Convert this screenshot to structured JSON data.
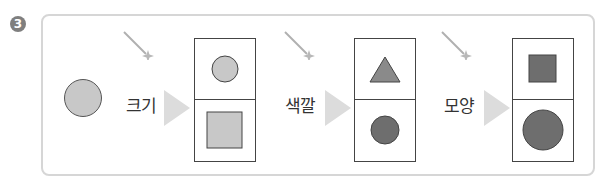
{
  "problem_number": "3",
  "start_shape": {
    "type": "circle",
    "size": "small",
    "color": "#c8c8c8"
  },
  "colors": {
    "light": "#c8c8c8",
    "dark": "#6e6e6e",
    "medium": "#8a8a8a",
    "arrow": "#dcdcdc",
    "frame": "#d6d6d6",
    "badge": "#7f7f7f"
  },
  "steps": [
    {
      "label": "크기",
      "icon": "magic-wand-icon",
      "top": {
        "type": "circle",
        "size": "small",
        "color": "#c8c8c8"
      },
      "bottom": {
        "type": "square",
        "size": "large",
        "color": "#c8c8c8"
      }
    },
    {
      "label": "색깔",
      "icon": "magic-wand-icon",
      "top": {
        "type": "triangle",
        "size": "medium",
        "color": "#8a8a8a"
      },
      "bottom": {
        "type": "circle",
        "size": "small",
        "color": "#6e6e6e"
      }
    },
    {
      "label": "모양",
      "icon": "magic-wand-icon",
      "top": {
        "type": "square",
        "size": "small",
        "color": "#6e6e6e"
      },
      "bottom": {
        "type": "circle",
        "size": "large",
        "color": "#6e6e6e"
      }
    }
  ]
}
